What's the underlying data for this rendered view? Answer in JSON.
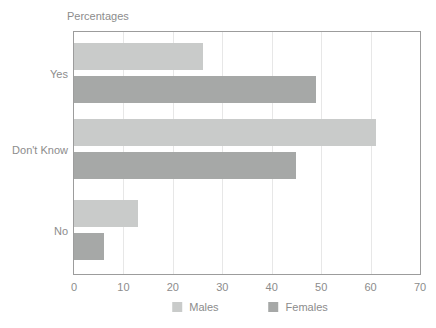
{
  "chart_data": {
    "type": "bar",
    "orientation": "horizontal",
    "title": "Percentages",
    "categories": [
      "Yes",
      "Don't Know",
      "No"
    ],
    "series": [
      {
        "name": "Males",
        "color": "#c9cbca",
        "values": [
          26,
          61,
          13
        ]
      },
      {
        "name": "Females",
        "color": "#a6a8a7",
        "values": [
          49,
          45,
          6
        ]
      }
    ],
    "xlabel": "",
    "ylabel": "",
    "xlim": [
      0,
      70
    ],
    "xticks": [
      0,
      10,
      20,
      30,
      40,
      50,
      60,
      70
    ],
    "grid": true,
    "legend_position": "bottom"
  },
  "colors": {
    "text": "#8c8c8c",
    "grid": "#e7e7e7",
    "plot_border": "#9c9c9c",
    "background": "#ffffff"
  }
}
